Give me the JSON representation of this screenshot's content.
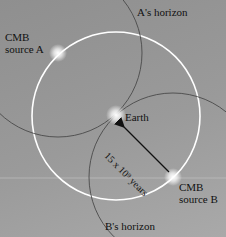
{
  "labels": {
    "source_a_line1": "CMB",
    "source_a_line2": "source A",
    "source_b_line1": "CMB",
    "source_b_line2": "source B",
    "earth": "Earth",
    "a_horizon": "A's horizon",
    "b_horizon": "B's horizon",
    "distance": "15 x 10⁹ years"
  },
  "colors": {
    "observable_circle": "#ffffff",
    "horizon": "#444444",
    "arrow": "#111111"
  }
}
